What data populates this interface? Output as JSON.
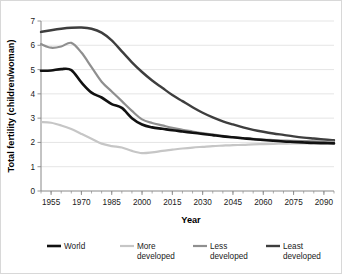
{
  "chart_data": {
    "type": "line",
    "title": "",
    "xlabel": "Year",
    "ylabel": "Total fertility (children/woman)",
    "xlim": [
      1950,
      2095
    ],
    "ylim": [
      0,
      7
    ],
    "grid": true,
    "legend_position": "bottom",
    "y_ticks": [
      "0",
      "1",
      "2",
      "3",
      "4",
      "5",
      "6",
      "7"
    ],
    "x_ticks": [
      "1955",
      "1970",
      "1985",
      "2000",
      "2015",
      "2030",
      "2045",
      "2060",
      "2075",
      "2090"
    ],
    "x_minor_interval": 5,
    "x": [
      1950,
      1955,
      1960,
      1965,
      1970,
      1975,
      1980,
      1985,
      1990,
      1995,
      2000,
      2005,
      2010,
      2015,
      2020,
      2025,
      2030,
      2035,
      2040,
      2045,
      2050,
      2055,
      2060,
      2065,
      2070,
      2075,
      2080,
      2085,
      2090,
      2095
    ],
    "series": [
      {
        "name": "World",
        "color": "#111111",
        "width": 2.6,
        "values": [
          4.95,
          4.96,
          5.02,
          4.98,
          4.47,
          4.05,
          3.85,
          3.58,
          3.42,
          3.0,
          2.74,
          2.62,
          2.56,
          2.5,
          2.45,
          2.4,
          2.35,
          2.3,
          2.25,
          2.21,
          2.17,
          2.13,
          2.1,
          2.07,
          2.04,
          2.02,
          2.0,
          1.98,
          1.97,
          1.96
        ]
      },
      {
        "name": "More developed",
        "color": "#c6c6c6",
        "width": 2.2,
        "values": [
          2.84,
          2.81,
          2.7,
          2.55,
          2.35,
          2.15,
          1.95,
          1.85,
          1.79,
          1.65,
          1.56,
          1.59,
          1.65,
          1.7,
          1.75,
          1.79,
          1.82,
          1.85,
          1.87,
          1.89,
          1.9,
          1.92,
          1.93,
          1.94,
          1.95,
          1.96,
          1.96,
          1.97,
          1.97,
          1.98
        ]
      },
      {
        "name": "Less developed",
        "color": "#8f8f8f",
        "width": 2.2,
        "values": [
          6.05,
          5.9,
          5.95,
          6.1,
          5.7,
          5.1,
          4.5,
          4.1,
          3.7,
          3.3,
          2.95,
          2.8,
          2.7,
          2.6,
          2.52,
          2.45,
          2.38,
          2.32,
          2.27,
          2.22,
          2.18,
          2.15,
          2.12,
          2.1,
          2.08,
          2.06,
          2.05,
          2.04,
          2.03,
          2.02
        ]
      },
      {
        "name": "Least developed",
        "color": "#3e3e3e",
        "width": 2.4,
        "values": [
          6.55,
          6.62,
          6.68,
          6.72,
          6.73,
          6.68,
          6.52,
          6.2,
          5.75,
          5.3,
          4.9,
          4.55,
          4.25,
          3.95,
          3.7,
          3.45,
          3.22,
          3.03,
          2.87,
          2.74,
          2.62,
          2.52,
          2.44,
          2.37,
          2.31,
          2.25,
          2.2,
          2.16,
          2.12,
          2.09
        ]
      }
    ]
  },
  "legend": {
    "items": [
      {
        "label_line1": "World",
        "label_line2": ""
      },
      {
        "label_line1": "More",
        "label_line2": "developed"
      },
      {
        "label_line1": "Less",
        "label_line2": "developed"
      },
      {
        "label_line1": "Least",
        "label_line2": "developed"
      }
    ]
  }
}
